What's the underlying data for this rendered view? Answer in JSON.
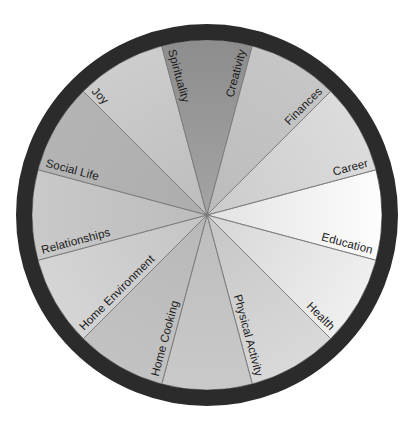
{
  "diagram": {
    "type": "pie-wheel",
    "center": {
      "x": 207,
      "y": 215
    },
    "inner_radius": 0,
    "wheel_radius": 175,
    "ring_inner_radius": 175,
    "ring_outer_radius": 191,
    "ring_color": "#2b2b2b",
    "background_color": "#ffffff",
    "divider_color": "#7d7d7d",
    "label_color": "#1b1b1b",
    "segment_count": 12,
    "segment_arc_degrees": 30,
    "segments": [
      {
        "label": "Career",
        "index": 0,
        "start_angle": -15,
        "end_angle": 15,
        "outer_color": "#fdfdfd",
        "inner_color": "#e2e2e2",
        "label_anchor": "end",
        "label_flip": false
      },
      {
        "label": "Education",
        "index": 1,
        "start_angle": 15,
        "end_angle": 45,
        "outer_color": "#efefef",
        "inner_color": "#d6d6d6",
        "label_anchor": "end",
        "label_flip": false
      },
      {
        "label": "Health",
        "index": 2,
        "start_angle": 45,
        "end_angle": 75,
        "outer_color": "#d9d9d9",
        "inner_color": "#c6c6c6",
        "label_anchor": "end",
        "label_flip": false
      },
      {
        "label": "Physical Activity",
        "index": 3,
        "start_angle": 75,
        "end_angle": 105,
        "outer_color": "#c9c9c9",
        "inner_color": "#bdbdbd",
        "label_anchor": "end",
        "label_flip": false
      },
      {
        "label": "Home Cooking",
        "index": 4,
        "start_angle": 105,
        "end_angle": 135,
        "outer_color": "#c2c2c2",
        "inner_color": "#b8b8b8",
        "label_anchor": "start",
        "label_flip": true
      },
      {
        "label": "Home Environment",
        "index": 5,
        "start_angle": 135,
        "end_angle": 165,
        "outer_color": "#d5d5d5",
        "inner_color": "#c4c4c4",
        "label_anchor": "start",
        "label_flip": true
      },
      {
        "label": "Relationships",
        "index": 6,
        "start_angle": 165,
        "end_angle": 195,
        "outer_color": "#c9c9c9",
        "inner_color": "#bcbcbc",
        "label_anchor": "start",
        "label_flip": true
      },
      {
        "label": "Social Life",
        "index": 7,
        "start_angle": 195,
        "end_angle": 225,
        "outer_color": "#b4b4b4",
        "inner_color": "#adadad",
        "label_anchor": "start",
        "label_flip": true
      },
      {
        "label": "Joy",
        "index": 8,
        "start_angle": 225,
        "end_angle": 255,
        "outer_color": "#cdcdcd",
        "inner_color": "#bdbdbd",
        "label_anchor": "start",
        "label_flip": true
      },
      {
        "label": "Spirituality",
        "index": 9,
        "start_angle": 255,
        "end_angle": 285,
        "outer_color": "#8d8d8d",
        "inner_color": "#a4a4a4",
        "label_anchor": "start",
        "label_flip": true
      },
      {
        "label": "Creativity",
        "index": 10,
        "start_angle": 285,
        "end_angle": 315,
        "outer_color": "#c6c6c6",
        "inner_color": "#bcbcbc",
        "label_anchor": "end",
        "label_flip": false
      },
      {
        "label": "Finances",
        "index": 11,
        "start_angle": 315,
        "end_angle": 345,
        "outer_color": "#dcdcdc",
        "inner_color": "#cbcbcb",
        "label_anchor": "end",
        "label_flip": false
      }
    ]
  }
}
